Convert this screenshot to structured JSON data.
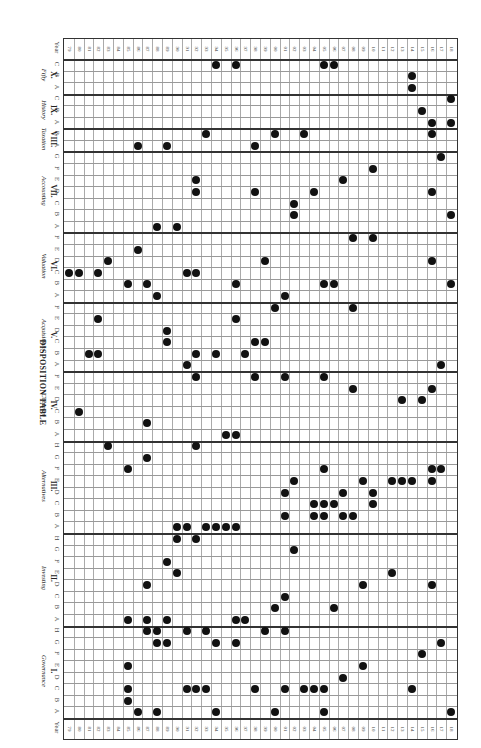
{
  "title": "DISPOSITION TABLE",
  "year_label": "Year",
  "years": [
    "79",
    "80",
    "81",
    "82",
    "83",
    "84",
    "85",
    "86",
    "87",
    "88",
    "89",
    "90",
    "91",
    "92",
    "93",
    "94",
    "95",
    "96",
    "97",
    "98",
    "99",
    "00",
    "01",
    "02",
    "03",
    "04",
    "05",
    "06",
    "07",
    "08",
    "09",
    "10",
    "11",
    "12",
    "13",
    "14",
    "15",
    "16",
    "17",
    "18"
  ],
  "sections": [
    {
      "num": "X.",
      "name": "Fifty",
      "rows": [
        "C",
        "B",
        "A"
      ]
    },
    {
      "num": "IX.",
      "name": "History",
      "rows": [
        "C",
        "B",
        "A"
      ]
    },
    {
      "num": "VIII.",
      "name": "Taxation",
      "rows": [
        "B",
        "A"
      ]
    },
    {
      "num": "VII.",
      "name": "Accounting",
      "rows": [
        "G",
        "F",
        "E",
        "D",
        "C",
        "B",
        "A"
      ]
    },
    {
      "num": "VI.",
      "name": "Valuation",
      "rows": [
        "F",
        "E",
        "D",
        "C",
        "B",
        "A"
      ]
    },
    {
      "num": "V.",
      "name": "Acquisitions",
      "rows": [
        "F",
        "E",
        "D",
        "C",
        "B",
        "A"
      ]
    },
    {
      "num": "IV.",
      "name": "Common",
      "rows": [
        "F",
        "E",
        "D",
        "C",
        "B",
        "A"
      ]
    },
    {
      "num": "III.",
      "name": "Alternatives",
      "rows": [
        "H",
        "G",
        "F",
        "E",
        "D",
        "C",
        "B",
        "A"
      ]
    },
    {
      "num": "II.",
      "name": "Investing",
      "rows": [
        "H",
        "G",
        "F",
        "E",
        "D",
        "C",
        "B",
        "A"
      ]
    },
    {
      "num": "I.",
      "name": "Governance",
      "rows": [
        "H",
        "G",
        "F",
        "E",
        "D",
        "C",
        "B",
        "A"
      ]
    }
  ],
  "dots": [
    [
      0,
      15
    ],
    [
      0,
      17
    ],
    [
      0,
      26
    ],
    [
      0,
      27
    ],
    [
      1,
      35
    ],
    [
      2,
      35
    ],
    [
      3,
      39
    ],
    [
      4,
      36
    ],
    [
      5,
      37
    ],
    [
      5,
      39
    ],
    [
      6,
      14
    ],
    [
      6,
      21
    ],
    [
      6,
      24
    ],
    [
      6,
      37
    ],
    [
      7,
      7
    ],
    [
      7,
      10
    ],
    [
      7,
      19
    ],
    [
      8,
      38
    ],
    [
      9,
      31
    ],
    [
      10,
      13
    ],
    [
      10,
      28
    ],
    [
      11,
      13
    ],
    [
      11,
      19
    ],
    [
      11,
      25
    ],
    [
      11,
      37
    ],
    [
      12,
      23
    ],
    [
      13,
      23
    ],
    [
      13,
      39
    ],
    [
      14,
      9
    ],
    [
      14,
      11
    ],
    [
      15,
      29
    ],
    [
      15,
      31
    ],
    [
      16,
      7
    ],
    [
      17,
      4
    ],
    [
      17,
      20
    ],
    [
      17,
      37
    ],
    [
      18,
      0
    ],
    [
      18,
      1
    ],
    [
      18,
      3
    ],
    [
      18,
      12
    ],
    [
      18,
      13
    ],
    [
      19,
      6
    ],
    [
      19,
      8
    ],
    [
      19,
      17
    ],
    [
      19,
      26
    ],
    [
      19,
      27
    ],
    [
      19,
      39
    ],
    [
      20,
      9
    ],
    [
      20,
      22
    ],
    [
      21,
      21
    ],
    [
      21,
      29
    ],
    [
      22,
      3
    ],
    [
      22,
      17
    ],
    [
      23,
      10
    ],
    [
      24,
      10
    ],
    [
      24,
      19
    ],
    [
      24,
      20
    ],
    [
      25,
      2
    ],
    [
      25,
      3
    ],
    [
      25,
      13
    ],
    [
      25,
      15
    ],
    [
      25,
      18
    ],
    [
      26,
      12
    ],
    [
      26,
      38
    ],
    [
      27,
      13
    ],
    [
      27,
      19
    ],
    [
      27,
      22
    ],
    [
      27,
      26
    ],
    [
      28,
      29
    ],
    [
      28,
      37
    ],
    [
      29,
      34
    ],
    [
      29,
      36
    ],
    [
      30,
      1
    ],
    [
      31,
      8
    ],
    [
      32,
      16
    ],
    [
      32,
      17
    ],
    [
      33,
      4
    ],
    [
      33,
      13
    ],
    [
      34,
      8
    ],
    [
      35,
      6
    ],
    [
      35,
      26
    ],
    [
      35,
      37
    ],
    [
      35,
      38
    ],
    [
      36,
      23
    ],
    [
      36,
      30
    ],
    [
      36,
      33
    ],
    [
      36,
      34
    ],
    [
      36,
      35
    ],
    [
      36,
      37
    ],
    [
      37,
      22
    ],
    [
      37,
      28
    ],
    [
      37,
      31
    ],
    [
      38,
      25
    ],
    [
      38,
      26
    ],
    [
      38,
      27
    ],
    [
      38,
      31
    ],
    [
      39,
      22
    ],
    [
      39,
      25
    ],
    [
      39,
      26
    ],
    [
      39,
      28
    ],
    [
      39,
      29
    ],
    [
      40,
      11
    ],
    [
      40,
      12
    ],
    [
      40,
      14
    ],
    [
      40,
      15
    ],
    [
      40,
      16
    ],
    [
      40,
      17
    ],
    [
      41,
      11
    ],
    [
      41,
      13
    ],
    [
      42,
      23
    ],
    [
      43,
      10
    ],
    [
      44,
      11
    ],
    [
      44,
      33
    ],
    [
      45,
      8
    ],
    [
      45,
      30
    ],
    [
      45,
      37
    ],
    [
      46,
      22
    ],
    [
      47,
      21
    ],
    [
      47,
      27
    ],
    [
      48,
      6
    ],
    [
      48,
      8
    ],
    [
      48,
      10
    ],
    [
      48,
      17
    ],
    [
      48,
      18
    ],
    [
      49,
      8
    ],
    [
      49,
      9
    ],
    [
      49,
      12
    ],
    [
      49,
      14
    ],
    [
      49,
      20
    ],
    [
      49,
      22
    ],
    [
      50,
      9
    ],
    [
      50,
      10
    ],
    [
      50,
      15
    ],
    [
      50,
      17
    ],
    [
      50,
      38
    ],
    [
      51,
      36
    ],
    [
      52,
      6
    ],
    [
      52,
      30
    ],
    [
      53,
      28
    ],
    [
      54,
      6
    ],
    [
      54,
      12
    ],
    [
      54,
      13
    ],
    [
      54,
      14
    ],
    [
      54,
      19
    ],
    [
      54,
      22
    ],
    [
      54,
      24
    ],
    [
      54,
      25
    ],
    [
      54,
      26
    ],
    [
      54,
      35
    ],
    [
      55,
      6
    ],
    [
      56,
      7
    ],
    [
      56,
      9
    ],
    [
      56,
      15
    ],
    [
      56,
      21
    ],
    [
      56,
      26
    ],
    [
      56,
      39
    ]
  ],
  "chart_data": {
    "type": "table",
    "title": "DISPOSITION TABLE",
    "note": "Dot matrix: rows = section sub-categories (top-to-bottom in rotated image), columns = years 79–18. dots = [row_index, year_index]."
  }
}
